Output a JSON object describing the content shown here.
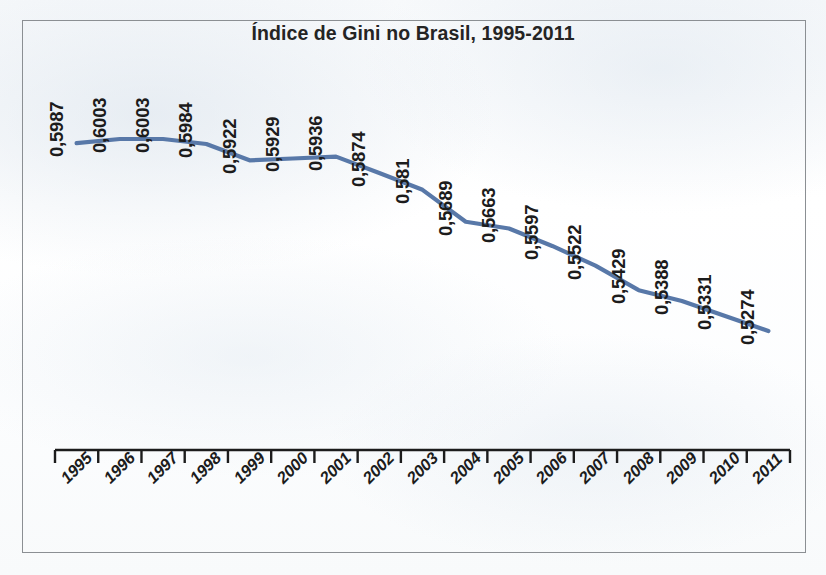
{
  "chart_data": {
    "type": "line",
    "title": "Índice de Gini no Brasil, 1995-2011",
    "xlabel": "",
    "ylabel": "",
    "categories": [
      "1995",
      "1996",
      "1997",
      "1998",
      "1999",
      "2000",
      "2001",
      "2002",
      "2003",
      "2004",
      "2005",
      "2006",
      "2007",
      "2008",
      "2009",
      "2010",
      "2011"
    ],
    "values": [
      0.5987,
      0.6003,
      0.6003,
      0.5984,
      0.5922,
      0.5929,
      0.5936,
      0.5874,
      0.581,
      0.5689,
      0.5663,
      0.5597,
      0.5522,
      0.5429,
      0.5388,
      0.5331,
      0.5274
    ],
    "value_labels": [
      "0,5987",
      "0,6003",
      "0,6003",
      "0,5984",
      "0,5922",
      "0,5929",
      "0,5936",
      "0,5874",
      "0,581",
      "0,5689",
      "0,5663",
      "0,5597",
      "0,5522",
      "0,5429",
      "0,5388",
      "0,5331",
      "0,5274"
    ],
    "series": [
      {
        "name": "Índice de Gini",
        "values": [
          0.5987,
          0.6003,
          0.6003,
          0.5984,
          0.5922,
          0.5929,
          0.5936,
          0.5874,
          0.581,
          0.5689,
          0.5663,
          0.5597,
          0.5522,
          0.5429,
          0.5388,
          0.5331,
          0.5274
        ]
      }
    ],
    "ylim": [
      0.5,
      0.61
    ],
    "grid": false,
    "legend": false,
    "legend_position": "none",
    "line_color": "#5878a8",
    "axis_color": "#1c1c1c",
    "frame_color": "#8b8f93",
    "note": "Valores rotulados acima da linha; eixo vertical sem escala visível."
  },
  "chart": {
    "title": "Índice de Gini no Brasil, 1995-2011"
  }
}
